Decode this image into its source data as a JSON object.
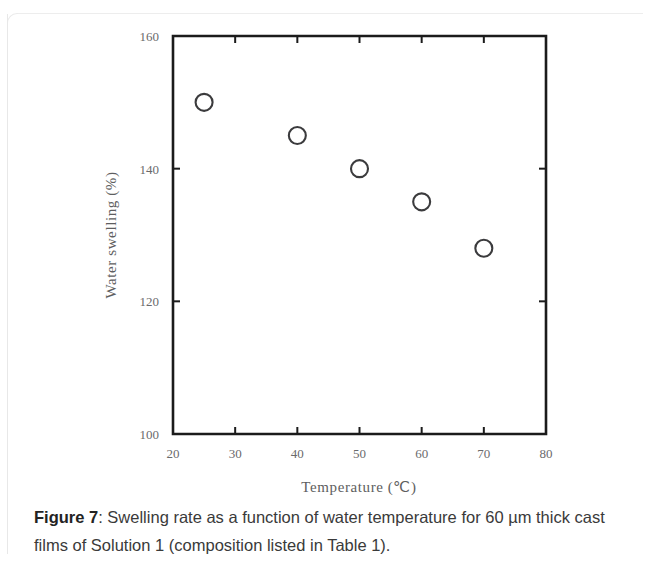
{
  "figure": {
    "caption_label": "Figure 7",
    "caption_separator": ": ",
    "caption_text": "Swelling rate as a function of water temperature for 60 µm thick cast films of Solution 1 (composition listed in Table 1)."
  },
  "chart_data": {
    "type": "scatter",
    "title": "",
    "xlabel": "Temperature  (℃)",
    "ylabel": "Water swelling (%)",
    "x": [
      25,
      40,
      50,
      60,
      70
    ],
    "values": [
      150,
      145,
      140,
      135,
      128
    ],
    "series": [
      {
        "name": "Water swelling",
        "x": [
          25,
          40,
          50,
          60,
          70
        ],
        "values": [
          150,
          145,
          140,
          135,
          128
        ]
      }
    ],
    "xlim": [
      20,
      80
    ],
    "ylim": [
      100,
      160
    ],
    "xticks": [
      20,
      30,
      40,
      50,
      60,
      70,
      80
    ],
    "yticks": [
      100,
      120,
      140,
      160
    ],
    "xtick_labels": [
      "20",
      "30",
      "40",
      "50",
      "60",
      "70",
      "80"
    ],
    "ytick_labels": [
      "100",
      "120",
      "140",
      "160"
    ],
    "grid": false,
    "legend": "none",
    "marker": "open-circle",
    "marker_color": "#3b3b3d",
    "axis_color": "#1b1b1b"
  }
}
